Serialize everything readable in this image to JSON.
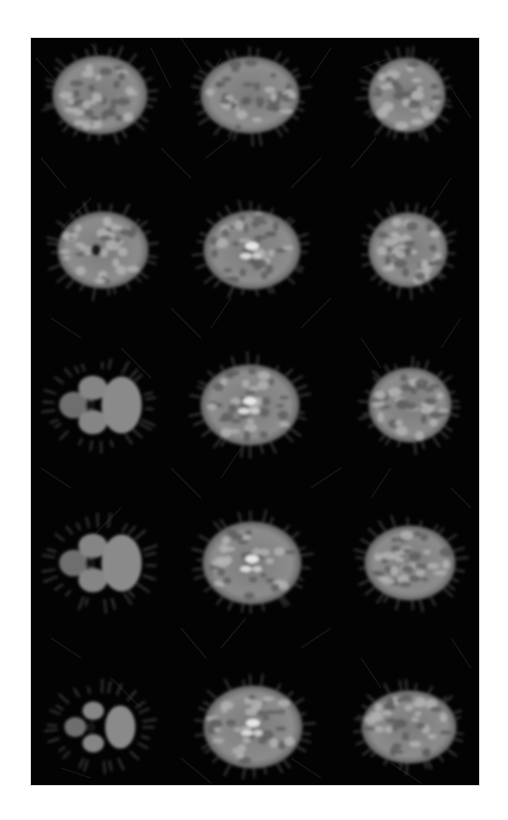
{
  "figure": {
    "rows": 5,
    "columns": 3,
    "background_color": "#030303",
    "page_color": "#ffffff",
    "tissue_color": "#8a8a8a",
    "highlight_color": "#e6e6e6",
    "slices": [
      {
        "row": 1,
        "col": 1,
        "cx": 69,
        "cy": 57,
        "w": 96,
        "h": 80,
        "type": "oval"
      },
      {
        "row": 1,
        "col": 2,
        "cx": 219,
        "cy": 57,
        "w": 100,
        "h": 78,
        "type": "oval"
      },
      {
        "row": 1,
        "col": 3,
        "cx": 376,
        "cy": 57,
        "w": 78,
        "h": 76,
        "type": "oval"
      },
      {
        "row": 2,
        "col": 1,
        "cx": 72,
        "cy": 212,
        "w": 92,
        "h": 78,
        "type": "oval-ventricle"
      },
      {
        "row": 2,
        "col": 2,
        "cx": 221,
        "cy": 212,
        "w": 98,
        "h": 80,
        "type": "oval-bright"
      },
      {
        "row": 2,
        "col": 3,
        "cx": 377,
        "cy": 212,
        "w": 80,
        "h": 76,
        "type": "oval"
      },
      {
        "row": 3,
        "col": 1,
        "cx": 69,
        "cy": 367,
        "w": 96,
        "h": 76,
        "type": "lobed"
      },
      {
        "row": 3,
        "col": 2,
        "cx": 219,
        "cy": 367,
        "w": 100,
        "h": 82,
        "type": "oval-bright"
      },
      {
        "row": 3,
        "col": 3,
        "cx": 379,
        "cy": 367,
        "w": 84,
        "h": 76,
        "type": "oval"
      },
      {
        "row": 4,
        "col": 1,
        "cx": 69,
        "cy": 525,
        "w": 96,
        "h": 76,
        "type": "lobed"
      },
      {
        "row": 4,
        "col": 2,
        "cx": 221,
        "cy": 525,
        "w": 100,
        "h": 84,
        "type": "oval-bright"
      },
      {
        "row": 4,
        "col": 3,
        "cx": 379,
        "cy": 525,
        "w": 92,
        "h": 76,
        "type": "oval"
      },
      {
        "row": 5,
        "col": 1,
        "cx": 69,
        "cy": 689,
        "w": 90,
        "h": 72,
        "type": "lobed-small"
      },
      {
        "row": 5,
        "col": 2,
        "cx": 222,
        "cy": 689,
        "w": 100,
        "h": 84,
        "type": "oval-bright"
      },
      {
        "row": 5,
        "col": 3,
        "cx": 378,
        "cy": 689,
        "w": 96,
        "h": 74,
        "type": "oval"
      }
    ]
  }
}
